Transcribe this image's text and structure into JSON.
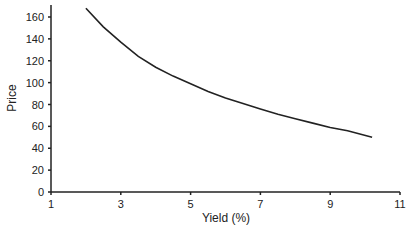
{
  "chart_data": {
    "type": "line",
    "title": "",
    "xlabel": "Yield (%)",
    "ylabel": "Price",
    "xlim": [
      1,
      11
    ],
    "ylim": [
      0,
      170
    ],
    "x_ticks": [
      1,
      3,
      5,
      7,
      9,
      11
    ],
    "y_ticks": [
      0,
      20,
      40,
      60,
      80,
      100,
      120,
      140,
      160
    ],
    "grid": false,
    "legend": null,
    "series": [
      {
        "name": "Price",
        "color": "#222222",
        "x": [
          2.0,
          2.5,
          3.0,
          3.5,
          4.0,
          4.5,
          5.0,
          5.5,
          6.0,
          6.5,
          7.0,
          7.5,
          8.0,
          8.5,
          9.0,
          9.5,
          10.2
        ],
        "y": [
          168,
          151,
          137,
          124,
          114,
          106,
          99,
          92,
          86,
          81,
          76,
          71,
          67,
          63,
          59,
          56,
          50
        ]
      }
    ]
  }
}
